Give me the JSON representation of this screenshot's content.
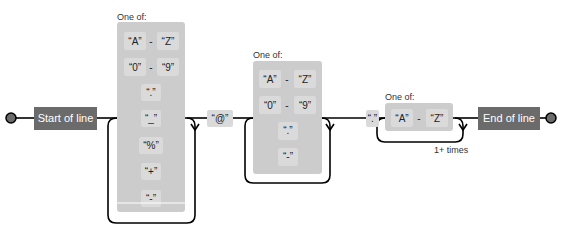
{
  "diagram": {
    "type": "regex-railroad",
    "start_anchor": "Start of line",
    "end_anchor": "End of line",
    "group_label": "One of:",
    "range_separator": "-",
    "groups": [
      {
        "id": "local-part",
        "label": "One of:",
        "ranges": [
          [
            "A",
            "Z"
          ],
          [
            "0",
            "9"
          ]
        ],
        "literals": [
          ".",
          "_",
          "%",
          "+",
          "-"
        ],
        "repeat": "loop"
      },
      {
        "id": "domain",
        "label": "One of:",
        "ranges": [
          [
            "A",
            "Z"
          ],
          [
            "0",
            "9"
          ]
        ],
        "literals": [
          ".",
          "-"
        ],
        "repeat": "loop"
      },
      {
        "id": "tld",
        "label": "One of:",
        "ranges": [
          [
            "A",
            "Z"
          ]
        ],
        "literals": [],
        "repeat": "1+ times"
      }
    ],
    "at_literal": "@",
    "dot_literal": ".",
    "repeat_label": "1+ times"
  },
  "colors": {
    "anchor_fill": "#6b6b6b",
    "group_fill": "#cccccc",
    "literal_fill": "#dadada",
    "line": "#000000",
    "terminal": "#6b6b6b"
  }
}
